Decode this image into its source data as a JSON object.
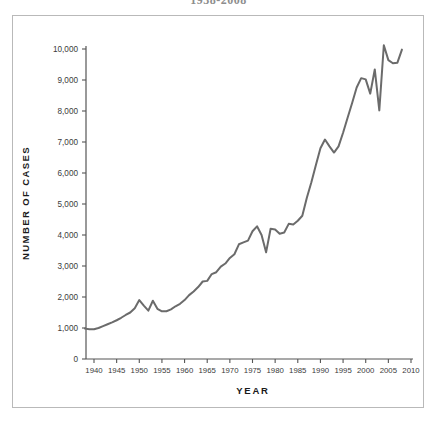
{
  "figure": {
    "title": "1938-2008",
    "frame_color": "#b9b9b9",
    "background": "#ffffff"
  },
  "chart_data": {
    "type": "line",
    "title": "1938-2008",
    "xlabel": "YEAR",
    "ylabel": "NUMBER OF CASES",
    "xlim": [
      1938,
      2011
    ],
    "ylim": [
      0,
      10500
    ],
    "grid": false,
    "legend": false,
    "line_color": "#6b6b6b",
    "line_width": 2.0,
    "xticks": [
      1940,
      1945,
      1950,
      1955,
      1960,
      1965,
      1970,
      1975,
      1980,
      1985,
      1990,
      1995,
      2000,
      2005,
      2010
    ],
    "xtick_labels": [
      "1940",
      "1945",
      "1950",
      "1955",
      "1960",
      "1965",
      "1970",
      "1975",
      "1980",
      "1985",
      "1990",
      "1995",
      "2000",
      "2005",
      "2010"
    ],
    "yticks": [
      0,
      1000,
      2000,
      3000,
      4000,
      5000,
      6000,
      7000,
      8000,
      9000,
      10000
    ],
    "ytick_labels": [
      "0",
      "1,000",
      "2,000",
      "3,000",
      "4,000",
      "5,000",
      "6,000",
      "7,000",
      "8,000",
      "9,000",
      "10,000"
    ],
    "series": [
      {
        "name": "Number of cases",
        "x": [
          1938,
          1939,
          1940,
          1941,
          1942,
          1943,
          1944,
          1945,
          1946,
          1947,
          1948,
          1949,
          1950,
          1951,
          1952,
          1953,
          1954,
          1955,
          1956,
          1957,
          1958,
          1959,
          1960,
          1961,
          1962,
          1963,
          1964,
          1965,
          1966,
          1967,
          1968,
          1969,
          1970,
          1971,
          1972,
          1973,
          1974,
          1975,
          1976,
          1977,
          1978,
          1979,
          1980,
          1981,
          1982,
          1983,
          1984,
          1985,
          1986,
          1987,
          1988,
          1989,
          1990,
          1991,
          1992,
          1993,
          1994,
          1995,
          1996,
          1997,
          1998,
          1999,
          2000,
          2001,
          2002,
          2003,
          2004,
          2005,
          2006,
          2007,
          2008
        ],
        "y": [
          980,
          960,
          960,
          1000,
          1060,
          1120,
          1180,
          1250,
          1330,
          1420,
          1500,
          1640,
          1900,
          1720,
          1560,
          1880,
          1620,
          1540,
          1540,
          1600,
          1700,
          1780,
          1900,
          2060,
          2180,
          2320,
          2500,
          2520,
          2740,
          2800,
          2980,
          3080,
          3260,
          3380,
          3700,
          3760,
          3820,
          4120,
          4280,
          4000,
          3440,
          4200,
          4180,
          4040,
          4080,
          4360,
          4340,
          4460,
          4620,
          5200,
          5700,
          6260,
          6800,
          7080,
          6860,
          6660,
          6860,
          7300,
          7780,
          8260,
          8760,
          9060,
          9020,
          8560,
          9340,
          8020,
          10120,
          9640,
          9540,
          9560,
          9980
        ]
      }
    ]
  }
}
